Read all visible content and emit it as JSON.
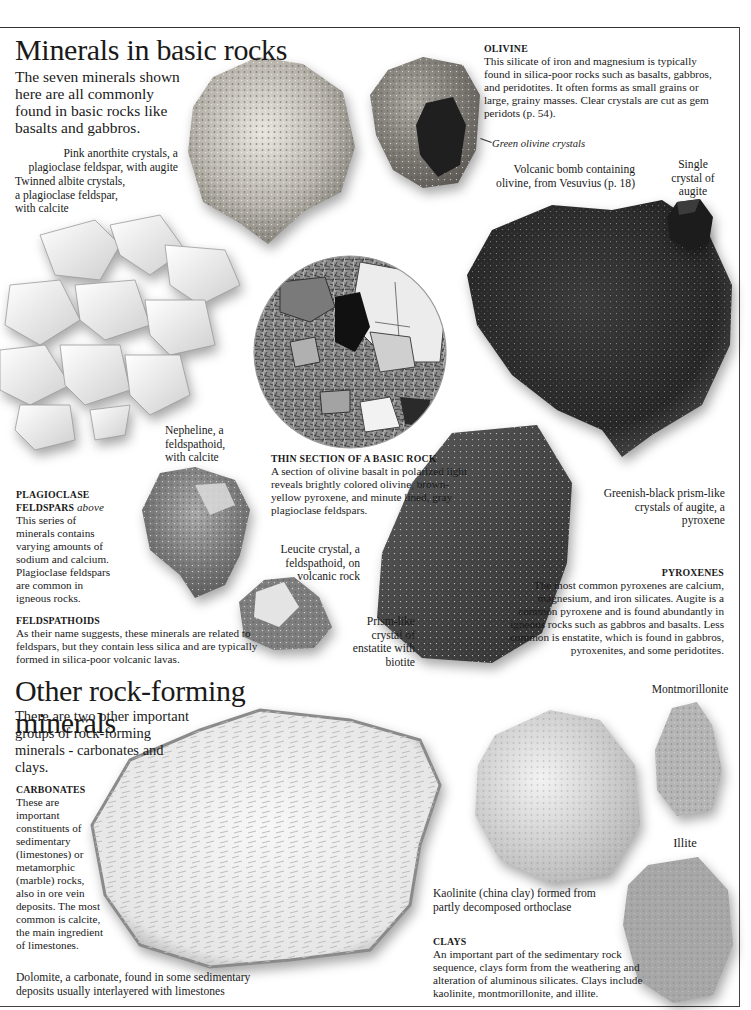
{
  "section1": {
    "title": "Minerals in basic rocks",
    "intro": "The seven minerals shown here are all commonly found in basic rocks like basalts and gabbros.",
    "captions": {
      "anorthite": "Pink anorthite crystals, a plagioclase feldspar, with augite",
      "albite": "Twinned albite crystals, a plagioclase feldspar, with calcite",
      "green_olivine": "Green olivine crystals",
      "volcanic_bomb": "Volcanic bomb containing olivine, from Vesuvius (p. 18)",
      "single_augite": "Single crystal of augite",
      "nepheline": "Nepheline, a feldspathoid, with calcite",
      "leucite": "Leucite crystal, a feldspathoid, on volcanic rock",
      "enstatite": "Prism-like crystal of enstatite with biotite",
      "augite_prisms": "Greenish-black prism-like crystals of augite, a pyroxene"
    },
    "olivine": {
      "heading": "OLIVINE",
      "text": "This silicate of iron and magnesium is typically found in silica-poor rocks such as basalts, gabbros, and peridotites. It often forms as small grains or large, grainy masses. Clear crystals are cut as gem peridots (p. 54)."
    },
    "thin_section": {
      "heading": "THIN SECTION OF A BASIC ROCK",
      "text": "A section of olivine basalt in polarized light reveals brightly colored olivine, brown-yellow pyroxene, and minute lined, gray plagioclase feldspars."
    },
    "plagioclase": {
      "heading": "PLAGIOCLASE FELDSPARS",
      "heading_note": "above",
      "text": "This series of minerals contains varying amounts of sodium and calcium. Plagioclase feldspars are common in igneous rocks."
    },
    "feldspathoids": {
      "heading": "FELDSPATHOIDS",
      "text": "As their name suggests, these minerals are related to feldspars, but they contain less silica and are typically formed in silica-poor volcanic lavas."
    },
    "pyroxenes": {
      "heading": "PYROXENES",
      "text": "The most common pyroxenes are calcium, magnesium, and iron silicates. Augite is a common pyroxene and is found abundantly in igneous rocks such as gabbros and basalts. Less common is enstatite, which is found in gabbros, pyroxenites, and some peridotites."
    }
  },
  "section2": {
    "title": "Other rock-forming minerals",
    "intro": "There are two other important groups of rock-forming minerals - carbonates and clays.",
    "carbonates": {
      "heading": "CARBONATES",
      "text": "These are important constituents of sedimentary (limestones) or metamorphic (marble) rocks, also in ore vein deposits. The most common is calcite, the main ingredient of limestones."
    },
    "clays": {
      "heading": "CLAYS",
      "text": "An important part of the sedimentary rock sequence, clays form from the weathering and alteration of aluminous silicates. Clays include kaolinite, montmorillonite, and illite."
    },
    "captions": {
      "dolomite": "Dolomite, a carbonate, found in some sedimentary deposits usually interlayered with limestones",
      "kaolinite": "Kaolinite (china clay) formed from partly decomposed orthoclase",
      "montmorillonite": "Montmorillonite",
      "illite": "Illite"
    }
  }
}
